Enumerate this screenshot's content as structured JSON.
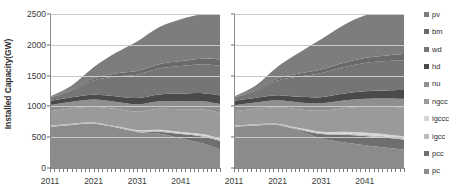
{
  "chart_data": {
    "type": "area",
    "title": "",
    "xlabel": "",
    "ylabel": "Installed Capacity(GW)",
    "ylim": [
      0,
      2500
    ],
    "xlim": [
      2011,
      2050
    ],
    "yticks": [
      0,
      500,
      1000,
      1500,
      2000,
      2500
    ],
    "xticks": [
      2011,
      2021,
      2031,
      2041
    ],
    "grid": true,
    "legend_position": "right-outside",
    "stacked": true,
    "panels": [
      {
        "name": "left-panel",
        "x": [
          2011,
          2016,
          2021,
          2026,
          2031,
          2036,
          2041,
          2046,
          2050
        ],
        "series": [
          {
            "name": "pc",
            "values": [
              670,
              700,
              720,
              660,
              580,
              560,
              480,
              400,
              300
            ]
          },
          {
            "name": "pcc",
            "values": [
              0,
              0,
              0,
              0,
              10,
              30,
              70,
              110,
              140
            ]
          },
          {
            "name": "igcc",
            "values": [
              20,
              20,
              20,
              20,
              20,
              20,
              20,
              20,
              20
            ]
          },
          {
            "name": "igccc",
            "values": [
              0,
              0,
              0,
              0,
              5,
              10,
              15,
              20,
              20
            ]
          },
          {
            "name": "ngcc",
            "values": [
              230,
              250,
              260,
              280,
              300,
              340,
              370,
              400,
              420
            ]
          },
          {
            "name": "nu",
            "values": [
              100,
              105,
              110,
              115,
              120,
              125,
              130,
              135,
              140
            ]
          },
          {
            "name": "hd",
            "values": [
              70,
              75,
              80,
              90,
              100,
              110,
              120,
              130,
              140
            ]
          },
          {
            "name": "wd",
            "values": [
              50,
              110,
              230,
              320,
              380,
              420,
              450,
              470,
              480
            ]
          },
          {
            "name": "bm",
            "values": [
              10,
              20,
              35,
              50,
              60,
              70,
              80,
              90,
              100
            ]
          },
          {
            "name": "pv",
            "values": [
              10,
              60,
              180,
              330,
              480,
              600,
              680,
              720,
              740
            ]
          }
        ]
      },
      {
        "name": "right-panel",
        "x": [
          2011,
          2016,
          2021,
          2026,
          2031,
          2036,
          2041,
          2046,
          2050
        ],
        "series": [
          {
            "name": "pc",
            "values": [
              670,
              690,
              700,
              600,
              480,
              420,
              370,
              330,
              300
            ]
          },
          {
            "name": "pcc",
            "values": [
              0,
              0,
              0,
              20,
              70,
              120,
              150,
              160,
              160
            ]
          },
          {
            "name": "igcc",
            "values": [
              20,
              20,
              20,
              20,
              20,
              20,
              20,
              20,
              20
            ]
          },
          {
            "name": "igccc",
            "values": [
              0,
              0,
              0,
              10,
              20,
              30,
              35,
              35,
              35
            ]
          },
          {
            "name": "ngcc",
            "values": [
              230,
              250,
              270,
              300,
              340,
              380,
              420,
              450,
              470
            ]
          },
          {
            "name": "nu",
            "values": [
              100,
              105,
              110,
              115,
              120,
              125,
              130,
              135,
              140
            ]
          },
          {
            "name": "hd",
            "values": [
              70,
              75,
              80,
              90,
              100,
              110,
              120,
              130,
              140
            ]
          },
          {
            "name": "wd",
            "values": [
              50,
              115,
              240,
              330,
              390,
              430,
              460,
              475,
              485
            ]
          },
          {
            "name": "bm",
            "values": [
              10,
              20,
              35,
              50,
              60,
              70,
              80,
              90,
              100
            ]
          },
          {
            "name": "pv",
            "values": [
              10,
              65,
              190,
              340,
              490,
              610,
              690,
              730,
              750
            ]
          }
        ]
      }
    ],
    "legend": [
      {
        "label": "pv",
        "color": "#7d7d7d"
      },
      {
        "label": "bm",
        "color": "#6a6a6a"
      },
      {
        "label": "wd",
        "color": "#757575"
      },
      {
        "label": "hd",
        "color": "#4a4a4a"
      },
      {
        "label": "nu",
        "color": "#8f8f8f"
      },
      {
        "label": "ngcc",
        "color": "#9a9a9a"
      },
      {
        "label": "igccc",
        "color": "#d6d6d6"
      },
      {
        "label": "igcc",
        "color": "#bdbdbd"
      },
      {
        "label": "pcc",
        "color": "#6f6f6f"
      },
      {
        "label": "pc",
        "color": "#8b8b8b"
      }
    ],
    "series_colors": {
      "pc": "#8b8b8b",
      "pcc": "#6f6f6f",
      "igcc": "#bdbdbd",
      "igccc": "#d6d6d6",
      "ngcc": "#9a9a9a",
      "nu": "#8f8f8f",
      "hd": "#4a4a4a",
      "wd": "#757575",
      "bm": "#6a6a6a",
      "pv": "#7d7d7d"
    },
    "yticklabels": [
      "0",
      "500",
      "1000",
      "1500",
      "2000",
      "2500"
    ],
    "xticklabels": [
      "2011",
      "2021",
      "2031",
      "2041"
    ],
    "axis_color": "#8a8a8a",
    "grid_color": "#c9c9c9"
  }
}
